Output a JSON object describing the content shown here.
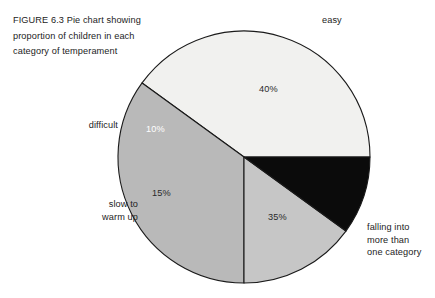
{
  "figure": {
    "caption_label": "FIGURE 6.3",
    "caption": "FIGURE 6.3  Pie chart showing proportion of children in each category of temperament"
  },
  "chart_data": {
    "type": "pie",
    "title": "Pie chart showing proportion of children in each category of temperament",
    "xlabel": "",
    "ylabel": "",
    "unit": "%",
    "total": 100,
    "legend_position": "outside-labels",
    "grid": false,
    "start_angle_deg": 0,
    "direction": "counterclockwise",
    "categories": [
      "easy",
      "falling into more than one category",
      "slow to warm up",
      "difficult"
    ],
    "values": [
      40,
      35,
      15,
      10
    ],
    "value_labels": [
      "40%",
      "35%",
      "15%",
      "10%"
    ],
    "colors": [
      "#f1f1ef",
      "#b9b9b9",
      "#c6c6c6",
      "#0b0b0b"
    ],
    "slices": [
      {
        "label": "easy",
        "label_lines": "easy",
        "value": 40,
        "value_label": "40%",
        "color": "#f1f1ef",
        "stroke": "#1a1a1a",
        "value_text_color": "#2a2a2a"
      },
      {
        "label": "falling into more than one category",
        "label_lines": "falling into\nmore than\none category",
        "value": 35,
        "value_label": "35%",
        "color": "#b9b9b9",
        "stroke": "#1a1a1a",
        "value_text_color": "#2a2a2a"
      },
      {
        "label": "slow to warm up",
        "label_lines": "slow to\nwarm up",
        "value": 15,
        "value_label": "15%",
        "color": "#c6c6c6",
        "stroke": "#1a1a1a",
        "value_text_color": "#2a2a2a"
      },
      {
        "label": "difficult",
        "label_lines": "difficult",
        "value": 10,
        "value_label": "10%",
        "color": "#0b0b0b",
        "stroke": "#1a1a1a",
        "value_text_color": "#ffffff"
      }
    ]
  }
}
